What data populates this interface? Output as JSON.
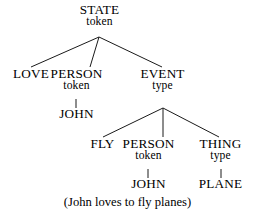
{
  "figure": {
    "kind": "semantic-network-tree",
    "caption": "(John loves to fly planes)",
    "background_color": "#ffffff",
    "line_color": "#1a1a1a",
    "text_color": "#000000"
  },
  "nodes": {
    "root": {
      "label": "STATE",
      "sub": "token"
    },
    "love": {
      "label": "LOVE",
      "sub": ""
    },
    "person1": {
      "label": "PERSON",
      "sub": "token"
    },
    "john1": {
      "label": "JOHN",
      "sub": ""
    },
    "event": {
      "label": "EVENT",
      "sub": "type"
    },
    "fly": {
      "label": "FLY",
      "sub": ""
    },
    "person2": {
      "label": "PERSON",
      "sub": "token"
    },
    "john2": {
      "label": "JOHN",
      "sub": ""
    },
    "thing": {
      "label": "THING",
      "sub": "type"
    },
    "plane": {
      "label": "PLANE",
      "sub": ""
    }
  },
  "edges": [
    {
      "from": "root",
      "to": "love"
    },
    {
      "from": "root",
      "to": "person1"
    },
    {
      "from": "root",
      "to": "event"
    },
    {
      "from": "person1",
      "to": "john1"
    },
    {
      "from": "event",
      "to": "fly"
    },
    {
      "from": "event",
      "to": "person2"
    },
    {
      "from": "event",
      "to": "thing"
    },
    {
      "from": "person2",
      "to": "john2"
    },
    {
      "from": "thing",
      "to": "plane"
    }
  ]
}
